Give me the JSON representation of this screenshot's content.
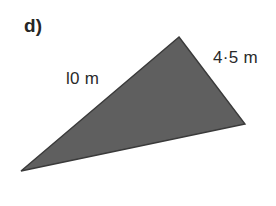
{
  "figure": {
    "part_label": "d)",
    "background_color": "#ffffff",
    "shape": {
      "name": "triangle",
      "fill_color": "#5f5f5f",
      "stroke_color": "#3a3a3a",
      "vertices": [
        {
          "name": "apex",
          "x": 179,
          "y": 37
        },
        {
          "name": "right",
          "x": 245,
          "y": 124
        },
        {
          "name": "left-tip",
          "x": 21,
          "y": 171
        }
      ]
    },
    "side_labels": [
      {
        "name": "left-side",
        "text": "l0 m",
        "value": 10,
        "unit": "m",
        "color": "#2a2a2a"
      },
      {
        "name": "right-side",
        "text": "4·5 m",
        "value": 4.5,
        "unit": "m",
        "color": "#2a2a2a"
      }
    ]
  }
}
